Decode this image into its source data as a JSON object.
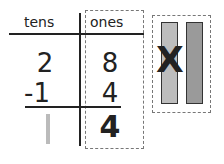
{
  "headers": {
    "tens": "tens",
    "ones": "ones"
  },
  "rows": [
    {
      "tens": "2",
      "ones": "8"
    },
    {
      "tens": "-1",
      "ones": "4"
    }
  ],
  "result": {
    "tens": "|",
    "ones": "4"
  },
  "rods": {
    "count": 2,
    "crossed_out": 1,
    "cross_glyph": "X"
  },
  "colors": {
    "ink": "#222222",
    "tens_result": "#bbbbbb",
    "rod_light": "#bdbdbd",
    "rod_dark": "#9a9a9a",
    "dash": "#777777"
  }
}
